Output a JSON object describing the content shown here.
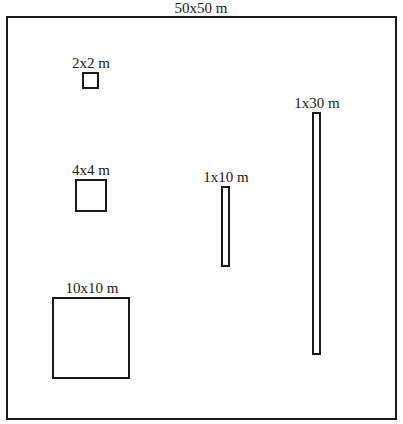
{
  "diagram": {
    "title": "50x50 m",
    "outer_area": {
      "label": "50x50 m"
    },
    "plots": [
      {
        "id": "plot-2x2",
        "label": "2x2 m"
      },
      {
        "id": "plot-4x4",
        "label": "4x4 m"
      },
      {
        "id": "plot-10x10",
        "label": "10x10 m"
      },
      {
        "id": "plot-1x10",
        "label": "1x10 m"
      },
      {
        "id": "plot-1x30",
        "label": "1x30 m"
      }
    ]
  }
}
